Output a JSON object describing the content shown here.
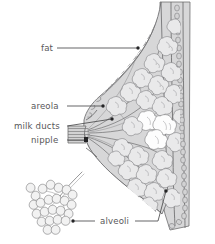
{
  "diagram": {
    "background_color": "#ffffff",
    "tissue_fill_color": "#d7d7d8",
    "lobule_fill_color": "#e9e9ea",
    "lobule_highlight_color": "#fdfdfd",
    "outline_color": "#6e6e70",
    "label_text_color": "#58585a",
    "leader_line_color": "#4a4a4c"
  },
  "labels": {
    "fat": "fat",
    "areola": "areola",
    "milk_ducts": "milk ducts",
    "nipple": "nipple",
    "alveoli": "alveoli"
  },
  "parts": [
    {
      "id": "fat",
      "label": "fat",
      "label_x": 41,
      "label_y": 51,
      "leader_from_x": 56,
      "leader_from_y": 48,
      "leader_to_x": 138,
      "leader_to_y": 48,
      "pointer": "adipose tissue region of breast"
    },
    {
      "id": "areola",
      "label": "areola",
      "label_x": 31,
      "label_y": 109,
      "leader_from_x": 66,
      "leader_from_y": 106,
      "leader_to_x": 103,
      "leader_to_y": 106,
      "pointer": "pigmented skin around nipple"
    },
    {
      "id": "milk-ducts",
      "label": "milk ducts",
      "label_x": 14,
      "label_y": 129,
      "leader_from_x": 66,
      "leader_from_y": 126,
      "leader_to_x": 110,
      "leader_to_y": 120,
      "pointer": "lactiferous ducts converging at nipple"
    },
    {
      "id": "nipple",
      "label": "nipple",
      "label_x": 31,
      "label_y": 143,
      "leader_from_x": 66,
      "leader_from_y": 140,
      "leader_to_x": 88,
      "leader_to_y": 140,
      "pointer": "nipple tip"
    },
    {
      "id": "alveoli",
      "label": "alveoli",
      "label_x": 100,
      "label_y": 224,
      "leader_left_from_x": 95,
      "leader_left_from_y": 221,
      "leader_left_to_x": 74,
      "leader_left_to_y": 221,
      "leader_right_from_x": 135,
      "leader_right_from_y": 221,
      "leader_right_to_x": 165,
      "leader_right_to_y": 192,
      "pointer": "milk-producing sacs, shown enlarged at lower left"
    }
  ],
  "inset": {
    "name": "alveoli-cluster-inset",
    "description": "enlarged grape-like cluster of alveoli with duct stalk",
    "center_x": 52,
    "center_y": 198
  }
}
